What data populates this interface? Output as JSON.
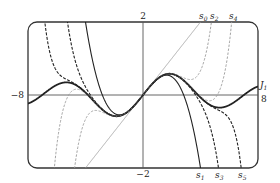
{
  "chart_data": {
    "type": "line",
    "title": "",
    "xlabel": "",
    "ylabel": "",
    "xlim": [
      -8,
      8
    ],
    "ylim": [
      -2,
      2
    ],
    "grid": false,
    "axis_tick_labels": {
      "x_left": "−8",
      "x_right": "8",
      "y_top": "2",
      "y_bottom": "−2"
    },
    "series": [
      {
        "name": "J1",
        "label": "J",
        "sub": "1",
        "kind": "bessel",
        "style": "thick",
        "color": "#222222"
      },
      {
        "name": "s0",
        "label": "s",
        "sub": "0",
        "kind": "partial",
        "n": 0,
        "style": "thin-solid",
        "color": "#9a9a9a",
        "label_pos": "top"
      },
      {
        "name": "s1",
        "label": "s",
        "sub": "1",
        "kind": "partial",
        "n": 1,
        "style": "solid",
        "color": "#222222",
        "label_pos": "bottom"
      },
      {
        "name": "s2",
        "label": "s",
        "sub": "2",
        "kind": "partial",
        "n": 2,
        "style": "dashed-gray",
        "color": "#9a9a9a",
        "label_pos": "top"
      },
      {
        "name": "s3",
        "label": "s",
        "sub": "3",
        "kind": "partial",
        "n": 3,
        "style": "dashed",
        "color": "#222222",
        "label_pos": "bottom"
      },
      {
        "name": "s4",
        "label": "s",
        "sub": "4",
        "kind": "partial",
        "n": 4,
        "style": "dashed-gray",
        "color": "#9a9a9a",
        "label_pos": "top"
      },
      {
        "name": "s5",
        "label": "s",
        "sub": "5",
        "kind": "partial",
        "n": 5,
        "style": "dashed",
        "color": "#222222",
        "label_pos": "bottom"
      }
    ]
  },
  "labels": {
    "y_top": "2",
    "y_bottom": "−2",
    "x_left": "−8",
    "x_right": "8",
    "j1_main": "J",
    "j1_sub": "1",
    "s0_main": "s",
    "s0_sub": "0",
    "s1_main": "s",
    "s1_sub": "1",
    "s2_main": "s",
    "s2_sub": "2",
    "s3_main": "s",
    "s3_sub": "3",
    "s4_main": "s",
    "s4_sub": "4",
    "s5_main": "s",
    "s5_sub": "5"
  }
}
